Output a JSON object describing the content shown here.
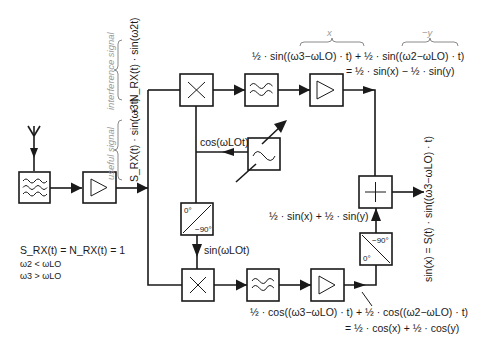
{
  "diagram": {
    "type": "quadrature image-reject receiver block diagram",
    "input": {
      "signal_expression_useful": "S_RX(t) · sin(ω3t)",
      "signal_expression_interference": "N_RX(t) · sin(ω2t)",
      "plus": "+",
      "label_useful": "useful signal",
      "label_interference": "interference signal"
    },
    "blocks": [
      {
        "id": "antenna",
        "kind": "antenna"
      },
      {
        "id": "bandpass-filter",
        "kind": "filter-bandpass"
      },
      {
        "id": "lna",
        "kind": "amplifier"
      },
      {
        "id": "mixer-top",
        "kind": "mixer"
      },
      {
        "id": "lowpass-top",
        "kind": "filter-lowpass"
      },
      {
        "id": "amp-top",
        "kind": "amplifier"
      },
      {
        "id": "local-oscillator",
        "kind": "oscillator-tunable"
      },
      {
        "id": "phase-splitter-lo",
        "kind": "phase-shifter",
        "labels": [
          "0°",
          "−90°"
        ]
      },
      {
        "id": "mixer-bottom",
        "kind": "mixer"
      },
      {
        "id": "lowpass-bottom",
        "kind": "filter-lowpass"
      },
      {
        "id": "amp-bottom",
        "kind": "amplifier"
      },
      {
        "id": "phase-shifter-out",
        "kind": "phase-shifter",
        "labels": [
          "−90°",
          "0°"
        ]
      },
      {
        "id": "summer",
        "kind": "adder"
      }
    ],
    "labels": {
      "lo_cos": "cos(ωLOt)",
      "lo_sin": "sin(ωLOt)",
      "top_brace_x": "x",
      "top_brace_y": "−y",
      "top_eq_line1": "½ · sin((ω3−ωLO) · t) + ½ · sin((ω2−ωLO) · t)",
      "top_eq_line2": "= ½ · sin(x) − ½ · sin(y)",
      "mid_eq": "½ · sin(x) + ½ · sin(y)",
      "bottom_eq_line1": "½ · cos((ω3−ωLO) · t) + ½ · cos((ω2−ωLO) · t)",
      "bottom_eq_line2": "= ½ · cos(x) + ½ · cos(y)",
      "output_eq": "sin(x) = S(t) · sin((ω3−ωLO) · t)",
      "phase1_top": "0°",
      "phase1_bottom": "−90°",
      "phase2_top": "−90°",
      "phase2_bottom": "0°"
    },
    "conditions": [
      "S_RX(t) = N_RX(t) = 1",
      "ω2 < ωLO",
      "ω3 > ωLO"
    ]
  }
}
